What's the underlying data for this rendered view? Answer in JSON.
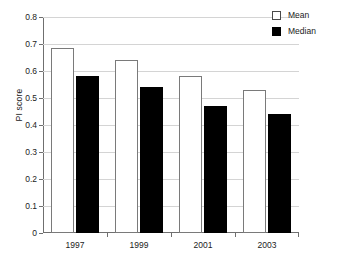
{
  "chart_data": {
    "type": "bar",
    "title": "",
    "xlabel": "",
    "ylabel": "PI score",
    "categories": [
      "1997",
      "1999",
      "2001",
      "2003"
    ],
    "series": [
      {
        "name": "Mean",
        "color": "#ffffff",
        "values": [
          0.685,
          0.64,
          0.58,
          0.53
        ]
      },
      {
        "name": "Median",
        "color": "#000000",
        "values": [
          0.58,
          0.54,
          0.47,
          0.44
        ]
      }
    ],
    "ylim": [
      0,
      0.8
    ],
    "ytick_labels": [
      "0",
      "0.1",
      "0.2",
      "0.3",
      "0.4",
      "0.5",
      "0.6",
      "0.7",
      "0.8"
    ],
    "ytick_values": [
      0,
      0.1,
      0.2,
      0.3,
      0.4,
      0.5,
      0.6,
      0.7,
      0.8
    ],
    "grid": true,
    "grid_axis": "y",
    "legend_position": "top-right-outside"
  },
  "legend": {
    "entries": [
      {
        "label": "Mean"
      },
      {
        "label": "Median"
      }
    ]
  }
}
